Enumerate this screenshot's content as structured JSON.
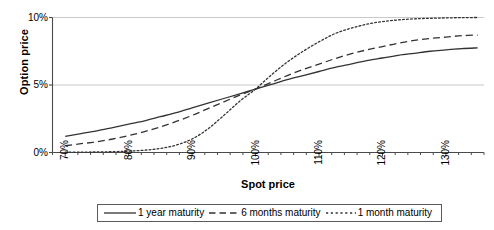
{
  "chart_data": {
    "type": "line",
    "title": "",
    "xlabel": "Spot price",
    "ylabel": "Option price",
    "xlim": [
      68,
      136
    ],
    "ylim": [
      0,
      10
    ],
    "xtick_labels": [
      "70%",
      "80%",
      "90%",
      "100%",
      "110%",
      "120%",
      "130%"
    ],
    "xtick_values": [
      70,
      80,
      90,
      100,
      110,
      120,
      130
    ],
    "ytick_labels": [
      "0%",
      "5%",
      "10%"
    ],
    "ytick_values": [
      0,
      5,
      10
    ],
    "grid": "horizontal",
    "legend_position": "below",
    "minor_xticks_per_interval": 4,
    "series": [
      {
        "name": "1 year maturity",
        "style": "solid",
        "color": "#333333",
        "x": [
          70,
          72.5,
          75,
          77.5,
          80,
          82.5,
          85,
          87.5,
          90,
          92.5,
          95,
          97.5,
          100,
          102.5,
          105,
          107.5,
          110,
          112.5,
          115,
          117.5,
          120,
          122.5,
          125,
          127.5,
          130,
          132.5,
          135
        ],
        "y": [
          1.2,
          1.4,
          1.6,
          1.85,
          2.1,
          2.35,
          2.65,
          2.95,
          3.3,
          3.65,
          4.0,
          4.35,
          4.7,
          5.05,
          5.4,
          5.7,
          6.0,
          6.3,
          6.55,
          6.8,
          7.0,
          7.2,
          7.35,
          7.5,
          7.6,
          7.7,
          7.75
        ]
      },
      {
        "name": "6 months maturity",
        "style": "dashed",
        "color": "#333333",
        "x": [
          70,
          72.5,
          75,
          77.5,
          80,
          82.5,
          85,
          87.5,
          90,
          92.5,
          95,
          97.5,
          100,
          102.5,
          105,
          107.5,
          110,
          112.5,
          115,
          117.5,
          120,
          122.5,
          125,
          127.5,
          130,
          132.5,
          135
        ],
        "y": [
          0.5,
          0.65,
          0.8,
          1.0,
          1.25,
          1.55,
          1.9,
          2.3,
          2.75,
          3.25,
          3.75,
          4.25,
          4.7,
          5.2,
          5.7,
          6.15,
          6.55,
          6.95,
          7.3,
          7.6,
          7.85,
          8.1,
          8.3,
          8.45,
          8.55,
          8.65,
          8.7
        ]
      },
      {
        "name": "1 month maturity",
        "style": "dotted",
        "color": "#333333",
        "x": [
          70,
          72.5,
          75,
          77.5,
          80,
          82.5,
          85,
          87.5,
          90,
          92.5,
          95,
          97.5,
          100,
          102.5,
          105,
          107.5,
          110,
          112.5,
          115,
          117.5,
          120,
          122.5,
          125,
          127.5,
          130,
          132.5,
          135
        ],
        "y": [
          0.02,
          0.03,
          0.04,
          0.06,
          0.1,
          0.17,
          0.3,
          0.55,
          1.0,
          1.75,
          2.75,
          3.8,
          4.7,
          5.75,
          6.7,
          7.5,
          8.2,
          8.8,
          9.2,
          9.5,
          9.7,
          9.82,
          9.9,
          9.94,
          9.97,
          9.99,
          10.0
        ]
      }
    ]
  },
  "axes": {
    "y_title": "Option price",
    "x_title": "Spot price"
  },
  "legend": {
    "items": [
      {
        "label": "1 year maturity",
        "style": "solid"
      },
      {
        "label": "6 months maturity",
        "style": "dashed"
      },
      {
        "label": "1 month maturity",
        "style": "dotted"
      }
    ]
  }
}
